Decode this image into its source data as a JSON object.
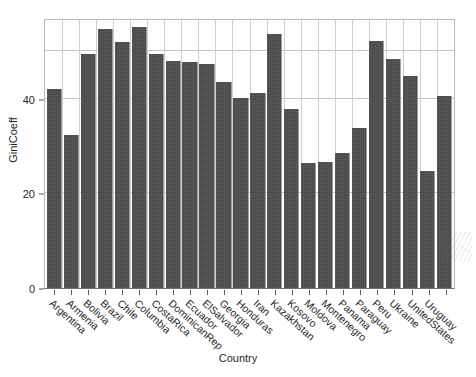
{
  "chart_data": {
    "type": "bar",
    "title": "",
    "xlabel": "Country",
    "ylabel": "GiniCoeff",
    "categories": [
      "Argentina",
      "Armenia",
      "Bolivia",
      "Brazil",
      "Chile",
      "Columbia",
      "CostaRica",
      "DominicanRep",
      "Ecuador",
      "ElSalvador",
      "Georgia",
      "Honduras",
      "Iran",
      "Kazakhstan",
      "Kosovo",
      "Moldova",
      "Montenegro",
      "Panama",
      "Paraguay",
      "Peru",
      "Ukraine",
      "UnitedStates",
      "Uruguay"
    ],
    "values": [
      42.0,
      32.4,
      49.3,
      54.7,
      51.9,
      55.0,
      49.5,
      48.0,
      47.7,
      47.2,
      43.4,
      40.2,
      53.6,
      37.8,
      26.4,
      26.6,
      28.5,
      33.7,
      52.2,
      48.3,
      44.8,
      24.7,
      40.5
    ],
    "y_ticks": [
      0,
      20,
      40
    ],
    "ylim": [
      0,
      57
    ],
    "grid": true,
    "grid_h_values": [
      20,
      40,
      50
    ],
    "legend": "none",
    "bar_color": "#474747",
    "n_bars": 24,
    "note_extra_bar_value": 41.2
  },
  "axes": {
    "y_title": "GiniCoeff",
    "x_title": "Country",
    "y_tick_labels": [
      "0",
      "20",
      "40"
    ]
  },
  "colors": {
    "bar": "#474747",
    "grid": "#c6c6c6",
    "axis": "#6e6e6e",
    "background": "#ffffff",
    "text": "#1f1f1f"
  },
  "bars": [
    {
      "label": "Argentina",
      "value": 42.0
    },
    {
      "label": "Armenia",
      "value": 32.4
    },
    {
      "label": "Bolivia",
      "value": 49.3
    },
    {
      "label": "Brazil",
      "value": 54.7
    },
    {
      "label": "Chile",
      "value": 51.9
    },
    {
      "label": "Columbia",
      "value": 55.0
    },
    {
      "label": "CostaRica",
      "value": 49.5
    },
    {
      "label": "DominicanRep",
      "value": 48.0
    },
    {
      "label": "Ecuador",
      "value": 47.7
    },
    {
      "label": "ElSalvador",
      "value": 47.2
    },
    {
      "label": "Georgia",
      "value": 43.4
    },
    {
      "label": "Honduras",
      "value": 40.2
    },
    {
      "label": "Iran",
      "value": 41.2
    },
    {
      "label": "Kazakhstan",
      "value": 53.6
    },
    {
      "label": "Kosovo",
      "value": 37.8
    },
    {
      "label": "Moldova",
      "value": 26.4
    },
    {
      "label": "Montenegro",
      "value": 26.6
    },
    {
      "label": "Panama",
      "value": 28.5
    },
    {
      "label": "Paraguay",
      "value": 33.7
    },
    {
      "label": "Peru",
      "value": 52.2
    },
    {
      "label": "Ukraine",
      "value": 48.3
    },
    {
      "label": "UnitedStates",
      "value": 44.8
    },
    {
      "label": "Uruguay",
      "value": 24.7
    },
    {
      "label": "",
      "value": 40.5
    }
  ],
  "x_tick_labels": [
    "Argentina",
    "Armenia",
    "Bolivia",
    "Brazil",
    "Chile",
    "Columbia",
    "CostaRica",
    "DominicanRep",
    "Ecuador",
    "ElSalvador",
    "Georgia",
    "Honduras",
    "Iran",
    "Kazakhstan",
    "Kosovo",
    "Moldova",
    "Montenegro",
    "Panama",
    "Paraguay",
    "Peru",
    "Ukraine",
    "UnitedStates",
    "Uruguay"
  ]
}
